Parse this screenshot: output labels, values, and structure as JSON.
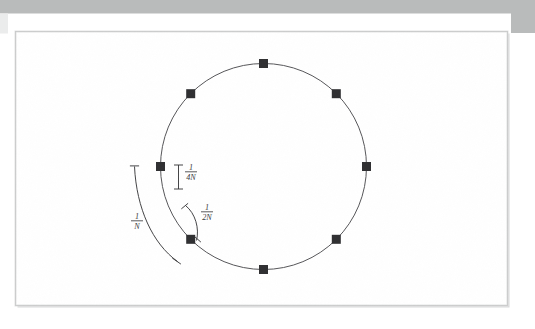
{
  "page": {
    "background_color": "#ffffff",
    "scan_band_color": "#b9bbbb",
    "paper_color": "#ffffff",
    "page_border_color": "#c9cacb",
    "shadow_color": "#d8d9da",
    "ink_color": "#3a3a3c",
    "marker_color": "#2f2f31"
  },
  "figure": {
    "type": "geometry-diagram",
    "circle": {
      "center_x": 263.5,
      "center_y": 166.5,
      "radius": 103,
      "stroke_color": "#565659",
      "stroke_width": 1.0,
      "fill": "none"
    },
    "markers": {
      "shape": "square",
      "count": 8,
      "size": 9,
      "color": "#2f2f31",
      "angles_deg": [
        270,
        315,
        0,
        45,
        90,
        135,
        180,
        225
      ],
      "points": [
        {
          "name": "marker-top",
          "angle_deg": 270,
          "x": 263.5,
          "y": 63.5
        },
        {
          "name": "marker-upper-right",
          "angle_deg": 315,
          "x": 336.3,
          "y": 93.7
        },
        {
          "name": "marker-right",
          "angle_deg": 0,
          "x": 366.5,
          "y": 166.5
        },
        {
          "name": "marker-lower-right",
          "angle_deg": 45,
          "x": 336.3,
          "y": 239.3
        },
        {
          "name": "marker-bottom",
          "angle_deg": 90,
          "x": 263.5,
          "y": 269.5
        },
        {
          "name": "marker-lower-left",
          "angle_deg": 135,
          "x": 190.7,
          "y": 239.3
        },
        {
          "name": "marker-left",
          "angle_deg": 180,
          "x": 160.5,
          "y": 166.5
        },
        {
          "name": "marker-upper-left",
          "angle_deg": 225,
          "x": 190.7,
          "y": 93.7
        }
      ]
    },
    "annotations": [
      {
        "id": "quarter-n",
        "label_numerator": "1",
        "label_denominator": "4N",
        "label_text": "1/4N",
        "bracket_style": "straight-i-beam",
        "orientation": "vertical",
        "label_x": 191,
        "label_y": 173,
        "bracket_x": 178.5,
        "bracket_top_y": 165,
        "bracket_bottom_y": 189
      },
      {
        "id": "half-n",
        "label_numerator": "1",
        "label_denominator": "2N",
        "label_text": "1/2N",
        "bracket_style": "curved-arc-with-ticks",
        "label_x": 207,
        "label_y": 213,
        "arc_start_x": 185.5,
        "arc_start_y": 205.5,
        "arc_end_x": 196.5,
        "arc_end_y": 240.5
      },
      {
        "id": "one-n",
        "label_numerator": "1",
        "label_denominator": "N",
        "label_text": "1/N",
        "bracket_style": "curved-arc-with-ticks",
        "label_x": 137,
        "label_y": 222,
        "arc_start_x": 134.5,
        "arc_start_y": 166.5,
        "arc_end_x": 177.5,
        "arc_end_y": 261.5
      }
    ]
  }
}
